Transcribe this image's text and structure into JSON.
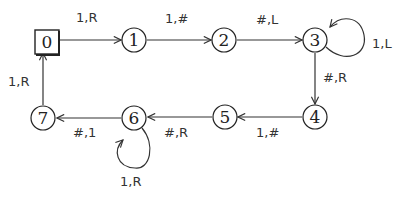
{
  "diagram": {
    "type": "state-machine",
    "nodes": [
      {
        "id": "0",
        "label": "0",
        "shape": "square",
        "start": true
      },
      {
        "id": "1",
        "label": "1",
        "shape": "circle"
      },
      {
        "id": "2",
        "label": "2",
        "shape": "circle"
      },
      {
        "id": "3",
        "label": "3",
        "shape": "circle"
      },
      {
        "id": "4",
        "label": "4",
        "shape": "circle"
      },
      {
        "id": "5",
        "label": "5",
        "shape": "circle"
      },
      {
        "id": "6",
        "label": "6",
        "shape": "circle"
      },
      {
        "id": "7",
        "label": "7",
        "shape": "circle"
      }
    ],
    "edges": [
      {
        "from": "0",
        "to": "1",
        "label": "1,R"
      },
      {
        "from": "1",
        "to": "2",
        "label": "1,#"
      },
      {
        "from": "2",
        "to": "3",
        "label": "#,L"
      },
      {
        "from": "3",
        "to": "3",
        "label": "1,L"
      },
      {
        "from": "3",
        "to": "4",
        "label": "#,R"
      },
      {
        "from": "4",
        "to": "5",
        "label": "1,#"
      },
      {
        "from": "5",
        "to": "6",
        "label": "#,R"
      },
      {
        "from": "6",
        "to": "6",
        "label": "1,R"
      },
      {
        "from": "6",
        "to": "7",
        "label": "#,1"
      },
      {
        "from": "7",
        "to": "0",
        "label": "1,R"
      }
    ]
  }
}
